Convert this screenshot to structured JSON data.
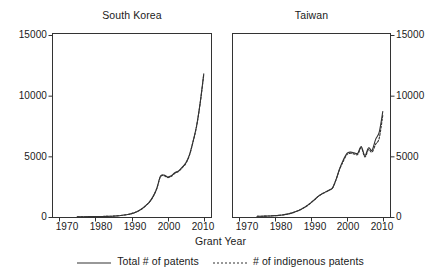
{
  "chart_data": {
    "type": "line",
    "title": "",
    "xlabel": "Grant Year",
    "ylabel": "",
    "xlim": [
      1968,
      2012
    ],
    "ylim": [
      0,
      15000
    ],
    "grid": false,
    "legend_position": "bottom",
    "xticks": [
      1970,
      1980,
      1990,
      2000,
      2010
    ],
    "yticks": [
      0,
      5000,
      10000,
      15000
    ],
    "ytick_labels": [
      "0",
      "5000",
      "10000",
      "15000"
    ],
    "xtick_labels": [
      "1970",
      "1980",
      "1990",
      "2000",
      "2010"
    ],
    "legend": [
      {
        "name": "Total # of patents",
        "style": "solid"
      },
      {
        "name": "# of indigenous patents",
        "style": "dotted"
      }
    ],
    "panels": [
      {
        "title": "South Korea",
        "yaxis_side": "left",
        "x": [
          1975,
          1976,
          1977,
          1978,
          1979,
          1980,
          1981,
          1982,
          1983,
          1984,
          1985,
          1986,
          1987,
          1988,
          1989,
          1990,
          1991,
          1992,
          1993,
          1994,
          1995,
          1996,
          1997,
          1998,
          1999,
          2000,
          2001,
          2002,
          2003,
          2004,
          2005,
          2006,
          2007,
          2008,
          2009,
          2010
        ],
        "series": [
          {
            "name": "Total # of patents",
            "style": "solid",
            "values": [
              20,
              22,
              25,
              28,
              30,
              35,
              40,
              45,
              50,
              60,
              75,
              95,
              120,
              160,
              210,
              280,
              380,
              520,
              700,
              950,
              1250,
              1700,
              2350,
              3350,
              3450,
              3300,
              3400,
              3650,
              3800,
              4100,
              4450,
              5100,
              6200,
              7500,
              9400,
              11800
            ]
          },
          {
            "name": "# of indigenous patents",
            "style": "dotted",
            "values": [
              20,
              22,
              25,
              28,
              30,
              35,
              40,
              45,
              50,
              60,
              75,
              95,
              120,
              160,
              210,
              280,
              380,
              520,
              700,
              950,
              1250,
              1700,
              2350,
              3300,
              3400,
              3250,
              3350,
              3600,
              3750,
              4050,
              4400,
              5050,
              6150,
              7450,
              9350,
              11750
            ]
          }
        ]
      },
      {
        "title": "Taiwan",
        "yaxis_side": "right",
        "x": [
          1975,
          1976,
          1977,
          1978,
          1979,
          1980,
          1981,
          1982,
          1983,
          1984,
          1985,
          1986,
          1987,
          1988,
          1989,
          1990,
          1991,
          1992,
          1993,
          1994,
          1995,
          1996,
          1997,
          1998,
          1999,
          2000,
          2001,
          2002,
          2003,
          2004,
          2005,
          2006,
          2007,
          2008,
          2009,
          2010
        ],
        "series": [
          {
            "name": "Total # of patents",
            "style": "solid",
            "values": [
              60,
              65,
              70,
              80,
              95,
              110,
              135,
              170,
              215,
              280,
              360,
              470,
              600,
              760,
              950,
              1180,
              1430,
              1700,
              1900,
              2050,
              2200,
              2400,
              3100,
              4000,
              4700,
              5250,
              5350,
              5300,
              5250,
              5800,
              5050,
              5700,
              5500,
              6400,
              7000,
              8700
            ]
          },
          {
            "name": "# of indigenous patents",
            "style": "dotted",
            "values": [
              60,
              65,
              70,
              80,
              95,
              110,
              135,
              170,
              215,
              280,
              360,
              470,
              600,
              760,
              950,
              1180,
              1430,
              1700,
              1900,
              2050,
              2200,
              2400,
              3100,
              3950,
              4600,
              5150,
              5250,
              5200,
              5150,
              5700,
              4950,
              5550,
              5350,
              6000,
              6500,
              8400
            ]
          }
        ]
      }
    ]
  },
  "axes": {
    "xaxis_label": "Grant Year"
  }
}
